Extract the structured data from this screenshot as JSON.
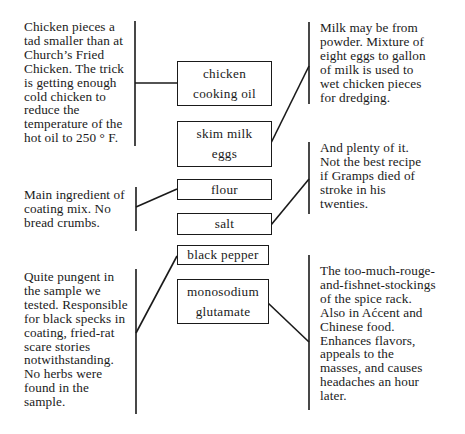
{
  "diagram": {
    "ingredients": [
      {
        "id": "chicken-oil",
        "lines": [
          "chicken",
          "cooking oil"
        ]
      },
      {
        "id": "milk-eggs",
        "lines": [
          "skim milk",
          "eggs"
        ]
      },
      {
        "id": "flour",
        "lines": [
          "flour"
        ]
      },
      {
        "id": "salt",
        "lines": [
          "salt"
        ]
      },
      {
        "id": "black-pepper",
        "lines": [
          "black pepper"
        ]
      },
      {
        "id": "msg",
        "lines": [
          "monosodium",
          "glutamate"
        ]
      }
    ],
    "notes": {
      "chicken_oil": "Chicken pieces a\ntad smaller than at\nChurch’s Fried\nChicken. The trick\nis getting enough\ncold chicken to\nreduce the\ntemperature of the\nhot oil to 250 ° F.",
      "milk_eggs": "Milk may be from\npowder. Mixture of\neight eggs to gallon\nof milk is used to\nwet chicken pieces\nfor dredging.",
      "flour": "Main ingredient of\ncoating mix. No\nbread crumbs.",
      "salt": "And plenty of it.\nNot the best recipe\nif Gramps died of\nstroke in his\ntwenties.",
      "black_pepper": "Quite pungent in\nthe sample we\ntested. Responsible\nfor black specks in\ncoating, fried-rat\nscare stories\nnotwithstanding.\nNo herbs were\nfound in the\nsample.",
      "msg": "The too-much-rouge-\nand-fishnet-stockings\nof the spice rack.\nAlso in Aćcent and\nChinese food.\nEnhances flavors,\nappeals to the\nmasses, and causes\nheadaches an hour\nlater."
    }
  }
}
